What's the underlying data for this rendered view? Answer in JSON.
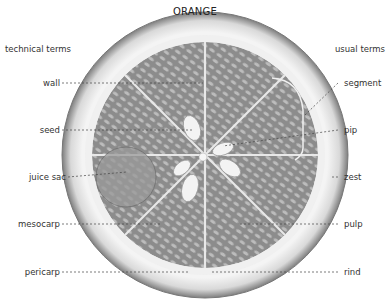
{
  "title": "ORANGE",
  "headers": {
    "left": "technical terms",
    "right": "usual terms"
  },
  "labels_left": [
    {
      "text": "wall",
      "y": 83
    },
    {
      "text": "seed",
      "y": 130
    },
    {
      "text": "juice sac",
      "y": 176
    },
    {
      "text": "mesocarp",
      "y": 224
    },
    {
      "text": "pericarp",
      "y": 270
    }
  ],
  "labels_right": [
    {
      "text": "segment",
      "y": 83
    },
    {
      "text": "pip",
      "y": 130
    },
    {
      "text": "zest",
      "y": 176
    },
    {
      "text": "pulp",
      "y": 224
    },
    {
      "text": "rind",
      "y": 270
    }
  ],
  "colors": {
    "rind_outer": "#8a8a8a",
    "rind_fill": "#e6e6e6",
    "pulp": "#8e8e8e",
    "sac_highlight": "#c9c9c9",
    "seed": "#f2f2f2",
    "leader": "#444444"
  }
}
